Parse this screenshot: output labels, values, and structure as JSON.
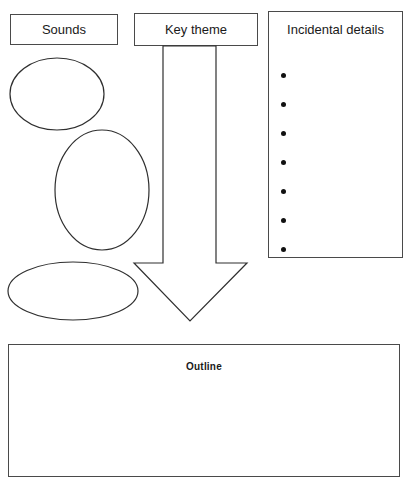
{
  "worksheet": {
    "title": "Story planning graphic organizer",
    "line_color": "#4a4a4a",
    "bullet_color": "#111111",
    "background": "#ffffff"
  },
  "boxes": {
    "sounds": {
      "label": "Sounds"
    },
    "key_theme": {
      "label": "Key theme"
    },
    "incidental_details": {
      "label": "Incidental details",
      "bullets": [
        "",
        "",
        "",
        "",
        "",
        "",
        ""
      ],
      "bullet_count": 7
    },
    "outline": {
      "label": "Outline",
      "body": ""
    }
  },
  "shapes": {
    "ellipse_1": {
      "name": "sounds-ellipse-1",
      "cx": 57,
      "cy": 94,
      "rx": 47,
      "ry": 36
    },
    "ellipse_2": {
      "name": "sounds-ellipse-2",
      "cx": 102,
      "cy": 190,
      "rx": 47,
      "ry": 60
    },
    "ellipse_3": {
      "name": "sounds-ellipse-3",
      "cx": 73,
      "cy": 291,
      "rx": 65,
      "ry": 29
    },
    "down_arrow": {
      "name": "key-theme-down-arrow",
      "points": "163,46 216,46 216,263 247,263 190,321 134,263 163,263"
    }
  }
}
